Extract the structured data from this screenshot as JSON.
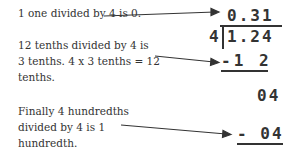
{
  "notes": {
    "step1": "1 one divided by 4 is 0.",
    "step2": [
      "12 tenths divided by 4 is",
      "3 tenths. 4 x 3 tenths = 12",
      "tenths."
    ],
    "step3": [
      "Finally 4 hundredths",
      "divided by 4 is 1",
      "hundredth."
    ]
  },
  "division": {
    "quotient": "0.31",
    "divisor": "4",
    "dividend": "1.24",
    "subtract1": "-1 2",
    "remainder1": "04",
    "subtract2": "- 04"
  }
}
